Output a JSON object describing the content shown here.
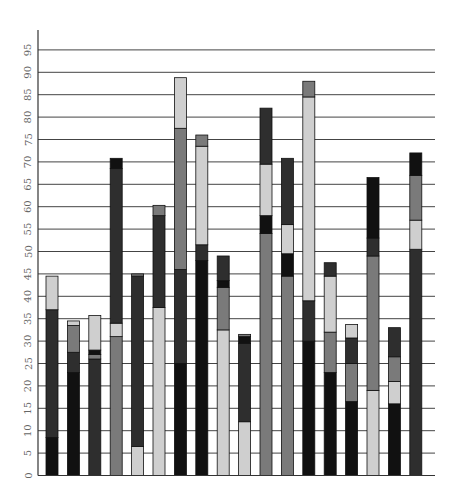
{
  "chart_data": {
    "type": "bar",
    "stacked": true,
    "title": "",
    "xlabel": "",
    "ylabel": "",
    "ylim": [
      0,
      100
    ],
    "yticks": [
      0,
      5,
      10,
      15,
      20,
      25,
      30,
      35,
      40,
      45,
      50,
      55,
      60,
      65,
      70,
      75,
      80,
      85,
      90,
      95
    ],
    "grid": true,
    "legend": null,
    "palette": {
      "black": "#111111",
      "dark": "#2e2e2e",
      "gray": "#7a7a7a",
      "light": "#cfcfcf"
    },
    "bars": [
      {
        "segments": [
          {
            "color": "black",
            "value": 8.5
          },
          {
            "color": "dark",
            "value": 28.5
          },
          {
            "color": "light",
            "value": 7.5
          }
        ]
      },
      {
        "segments": [
          {
            "color": "black",
            "value": 23
          },
          {
            "color": "dark",
            "value": 4.5
          },
          {
            "color": "gray",
            "value": 6
          },
          {
            "color": "light",
            "value": 1
          }
        ]
      },
      {
        "segments": [
          {
            "color": "dark",
            "value": 26
          },
          {
            "color": "gray",
            "value": 1
          },
          {
            "color": "black",
            "value": 1
          },
          {
            "color": "light",
            "value": 7.7
          }
        ]
      },
      {
        "segments": [
          {
            "color": "gray",
            "value": 31
          },
          {
            "color": "light",
            "value": 3
          },
          {
            "color": "dark",
            "value": 34.5
          },
          {
            "color": "black",
            "value": 2.3
          }
        ]
      },
      {
        "segments": [
          {
            "color": "light",
            "value": 6.5
          },
          {
            "color": "dark",
            "value": 38
          },
          {
            "color": "gray",
            "value": 0.5
          }
        ]
      },
      {
        "segments": [
          {
            "color": "light",
            "value": 37.5
          },
          {
            "color": "dark",
            "value": 20.5
          },
          {
            "color": "gray",
            "value": 2.3
          }
        ]
      },
      {
        "segments": [
          {
            "color": "black",
            "value": 25
          },
          {
            "color": "dark",
            "value": 21
          },
          {
            "color": "gray",
            "value": 31.5
          },
          {
            "color": "light",
            "value": 11.3
          }
        ]
      },
      {
        "segments": [
          {
            "color": "black",
            "value": 48
          },
          {
            "color": "dark",
            "value": 3.5
          },
          {
            "color": "light",
            "value": 22
          },
          {
            "color": "gray",
            "value": 2.5
          }
        ]
      },
      {
        "segments": [
          {
            "color": "light",
            "value": 32.5
          },
          {
            "color": "gray",
            "value": 9.5
          },
          {
            "color": "black",
            "value": 1.5
          },
          {
            "color": "dark",
            "value": 5.5
          }
        ]
      },
      {
        "segments": [
          {
            "color": "light",
            "value": 12
          },
          {
            "color": "dark",
            "value": 17.5
          },
          {
            "color": "black",
            "value": 1.5
          },
          {
            "color": "gray",
            "value": 0.5
          }
        ]
      },
      {
        "segments": [
          {
            "color": "gray",
            "value": 54
          },
          {
            "color": "black",
            "value": 4
          },
          {
            "color": "light",
            "value": 11.5
          },
          {
            "color": "dark",
            "value": 12.5
          }
        ]
      },
      {
        "segments": [
          {
            "color": "gray",
            "value": 44.5
          },
          {
            "color": "black",
            "value": 5
          },
          {
            "color": "light",
            "value": 6.5
          },
          {
            "color": "dark",
            "value": 14.8
          }
        ]
      },
      {
        "segments": [
          {
            "color": "black",
            "value": 30
          },
          {
            "color": "dark",
            "value": 9
          },
          {
            "color": "light",
            "value": 45.5
          },
          {
            "color": "gray",
            "value": 3.5
          }
        ]
      },
      {
        "segments": [
          {
            "color": "black",
            "value": 23
          },
          {
            "color": "gray",
            "value": 9
          },
          {
            "color": "light",
            "value": 12.5
          },
          {
            "color": "dark",
            "value": 3
          }
        ]
      },
      {
        "segments": [
          {
            "color": "black",
            "value": 16.5
          },
          {
            "color": "gray",
            "value": 8.5
          },
          {
            "color": "dark",
            "value": 5.7
          },
          {
            "color": "light",
            "value": 3
          }
        ]
      },
      {
        "segments": [
          {
            "color": "light",
            "value": 19
          },
          {
            "color": "gray",
            "value": 30
          },
          {
            "color": "dark",
            "value": 4
          },
          {
            "color": "black",
            "value": 13.5
          }
        ]
      },
      {
        "segments": [
          {
            "color": "black",
            "value": 16
          },
          {
            "color": "light",
            "value": 5
          },
          {
            "color": "gray",
            "value": 5.5
          },
          {
            "color": "dark",
            "value": 6.5
          }
        ]
      },
      {
        "segments": [
          {
            "color": "dark",
            "value": 50.5
          },
          {
            "color": "light",
            "value": 6.5
          },
          {
            "color": "gray",
            "value": 10
          },
          {
            "color": "black",
            "value": 5
          }
        ]
      }
    ],
    "totals": [
      44.5,
      34.5,
      35.7,
      70.8,
      45,
      60.3,
      88.8,
      76,
      49,
      31.5,
      82,
      70.8,
      88,
      47.5,
      33.7,
      66.5,
      33,
      72
    ]
  }
}
